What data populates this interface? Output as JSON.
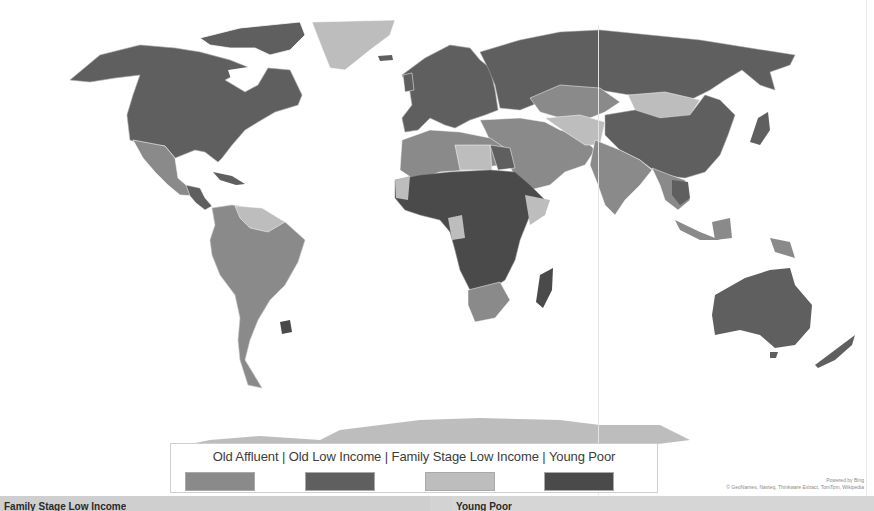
{
  "map": {
    "type": "choropleth",
    "projection": "world",
    "provider_credit": "Powered by Bing",
    "data_credit": "© GeoNames, Navteq, Thinkware Extract, TomTom, Wikipedia",
    "colors": {
      "old_affluent": "#8a8a8a",
      "old_low_income": "#5f5f5f",
      "family_stage_low_income": "#bdbdbd",
      "young_poor": "#4a4a4a",
      "background": "#ffffff",
      "border": "#cfcfcf"
    },
    "regions": [
      {
        "name": "North America (US, Canada)",
        "category": "Old Low Income"
      },
      {
        "name": "Greenland",
        "category": "Family Stage Low Income"
      },
      {
        "name": "Mexico",
        "category": "Old Affluent"
      },
      {
        "name": "South America",
        "category": "Old Affluent"
      },
      {
        "name": "Uruguay",
        "category": "Young Poor"
      },
      {
        "name": "Europe",
        "category": "Old Low Income"
      },
      {
        "name": "Russia",
        "category": "Old Low Income"
      },
      {
        "name": "China",
        "category": "Old Low Income"
      },
      {
        "name": "Kazakhstan",
        "category": "Old Affluent"
      },
      {
        "name": "Mongolia",
        "category": "Family Stage Low Income"
      },
      {
        "name": "Middle East",
        "category": "Old Affluent"
      },
      {
        "name": "India",
        "category": "Old Affluent"
      },
      {
        "name": "North Africa",
        "category": "Old Affluent"
      },
      {
        "name": "Central Africa",
        "category": "Young Poor"
      },
      {
        "name": "South Africa",
        "category": "Old Affluent"
      },
      {
        "name": "Madagascar",
        "category": "Young Poor"
      },
      {
        "name": "Australia",
        "category": "Old Low Income"
      },
      {
        "name": "New Zealand",
        "category": "Old Low Income"
      },
      {
        "name": "Indonesia",
        "category": "Old Affluent"
      },
      {
        "name": "Antarctica",
        "category": "Family Stage Low Income"
      }
    ]
  },
  "legend": {
    "title": "Old Affluent  |  Old Low Income | Family Stage Low Income | Young Poor",
    "items": [
      {
        "label": "Old Affluent",
        "color": "#8a8a8a"
      },
      {
        "label": "Old Low Income",
        "color": "#5f5f5f"
      },
      {
        "label": "Family Stage Low Income",
        "color": "#bdbdbd"
      },
      {
        "label": "Young Poor",
        "color": "#4a4a4a"
      }
    ]
  },
  "bottom_panels": {
    "left_label": "Family Stage Low Income",
    "right_label": "Young Poor"
  }
}
